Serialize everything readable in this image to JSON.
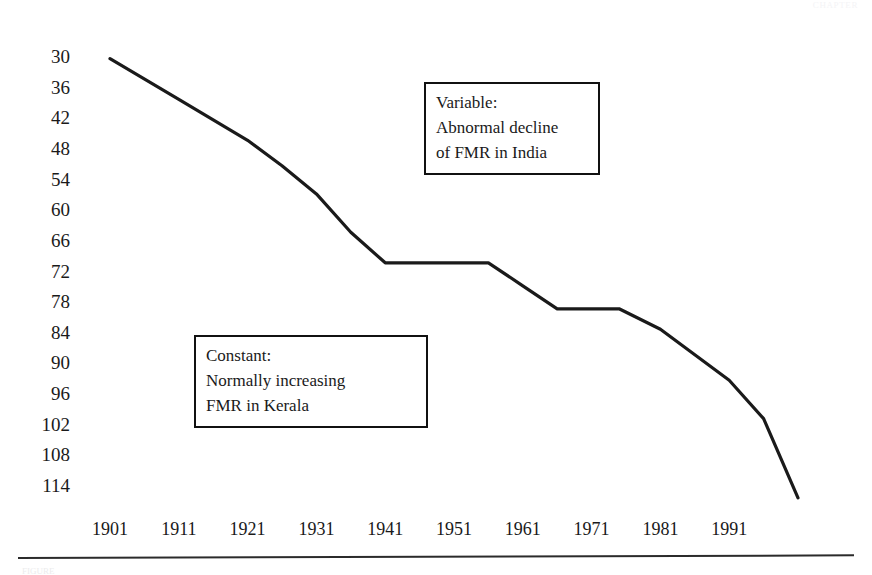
{
  "figure": {
    "running_header": "CHAPTER",
    "footer_cut_text": "FIGURE"
  },
  "chart_data": {
    "type": "line",
    "title": "",
    "subtitle": "",
    "xlabel": "",
    "ylabel": "",
    "grid": false,
    "legend_position": "none",
    "y_axis_inverted": true,
    "xlim": [
      1901,
      2001
    ],
    "ylim": [
      30,
      114
    ],
    "x_tick_labels": [
      "1901",
      "1911",
      "1921",
      "1931",
      "1941",
      "1951",
      "1961",
      "1971",
      "1981",
      "1991"
    ],
    "x_ticks": [
      1901,
      1911,
      1921,
      1931,
      1941,
      1951,
      1961,
      1971,
      1981,
      1991
    ],
    "y_tick_labels": [
      "30",
      "36",
      "42",
      "48",
      "54",
      "60",
      "66",
      "72",
      "78",
      "84",
      "90",
      "96",
      "102",
      "108",
      "114"
    ],
    "y_ticks": [
      30,
      36,
      42,
      48,
      54,
      60,
      66,
      72,
      78,
      84,
      90,
      96,
      102,
      108,
      114
    ],
    "series": [
      {
        "name": "Abnormal decline of FMR in India",
        "color": "#1a1a1a",
        "x": [
          1901,
          1911,
          1921,
          1926,
          1931,
          1936,
          1941,
          1951,
          1956,
          1961,
          1966,
          1971,
          1975,
          1981,
          1986,
          1991,
          1996,
          2001
        ],
        "values": [
          30.5,
          38.5,
          46.5,
          51.5,
          57.0,
          64.5,
          70.5,
          70.5,
          70.5,
          75.0,
          79.5,
          79.5,
          79.5,
          83.5,
          88.5,
          93.5,
          101.0,
          116.5
        ]
      }
    ],
    "annotations": [
      {
        "id": "variable-callout",
        "lines": [
          "Variable:",
          "Abnormal decline",
          "of FMR in India"
        ],
        "x_px": 424,
        "y_px": 82,
        "width_px": 152
      },
      {
        "id": "constant-callout",
        "lines": [
          "Constant:",
          "Normally increasing",
          "FMR in Kerala"
        ],
        "x_px": 194,
        "y_px": 335,
        "width_px": 210
      }
    ]
  }
}
